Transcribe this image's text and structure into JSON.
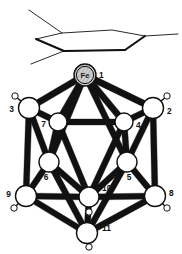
{
  "figure": {
    "kind": "molecular-structure-diagram",
    "background": "#ffffff",
    "line_color": "#111111",
    "sphere_fill": "#ffffff",
    "sphere_stroke": "#111111",
    "metal_fill": "#bdbdbd",
    "metal_stroke": "#111111",
    "width": 182,
    "height": 254
  },
  "arene_ligand": {
    "name": "hexagon-ring",
    "label": "",
    "ring_vertices": [
      {
        "x": 62,
        "y": 33
      },
      {
        "x": 112,
        "y": 30
      },
      {
        "x": 145,
        "y": 36
      },
      {
        "x": 125,
        "y": 50
      },
      {
        "x": 64,
        "y": 51
      },
      {
        "x": 36,
        "y": 39
      }
    ],
    "substituent_lines": [
      {
        "x1": 62,
        "y1": 33,
        "x2": 29,
        "y2": 10
      },
      {
        "x1": 64,
        "y1": 51,
        "x2": 31,
        "y2": 64
      },
      {
        "x1": 145,
        "y1": 36,
        "x2": 178,
        "y2": 34
      }
    ],
    "bold_edges": [
      {
        "x1": 36,
        "y1": 39,
        "x2": 64,
        "y2": 51
      },
      {
        "x1": 64,
        "y1": 51,
        "x2": 125,
        "y2": 50
      },
      {
        "x1": 125,
        "y1": 50,
        "x2": 145,
        "y2": 36
      }
    ]
  },
  "cluster": {
    "name": "icosahedral-ferracarborane-cluster",
    "metal_label": "Fe",
    "vertices": [
      {
        "id": "1",
        "label": "1",
        "element": "Fe",
        "x": 85,
        "y": 75,
        "r": 11,
        "metal": true,
        "label_dx": 14,
        "label_dy": 3,
        "h": null
      },
      {
        "id": "3",
        "label": "3",
        "element": "B",
        "x": 29,
        "y": 108,
        "r": 10.5,
        "metal": false,
        "label_dx": -15,
        "label_dy": 4,
        "h": {
          "x": 15,
          "y": 96,
          "r": 3.2
        }
      },
      {
        "id": "2",
        "label": "2",
        "element": "B",
        "x": 153,
        "y": 108,
        "r": 10.5,
        "metal": false,
        "label_dx": 14,
        "label_dy": 6,
        "h": {
          "x": 167,
          "y": 96,
          "r": 3.2
        }
      },
      {
        "id": "7",
        "label": "7",
        "element": "B",
        "x": 58,
        "y": 122,
        "r": 9,
        "metal": false,
        "label_dx": -12,
        "label_dy": 5,
        "h": null
      },
      {
        "id": "4",
        "label": "4",
        "element": "B",
        "x": 124,
        "y": 122,
        "r": 9,
        "metal": false,
        "label_dx": 12,
        "label_dy": 6,
        "h": null
      },
      {
        "id": "6",
        "label": "6",
        "element": "B",
        "x": 49,
        "y": 162,
        "r": 10,
        "metal": false,
        "label_dx": -3,
        "label_dy": 18,
        "h": {
          "x": 46,
          "y": 157,
          "r": 3.4
        }
      },
      {
        "id": "5",
        "label": "5",
        "element": "B",
        "x": 127,
        "y": 162,
        "r": 10,
        "metal": false,
        "label_dx": 2,
        "label_dy": 18,
        "h": {
          "x": 131,
          "y": 158,
          "r": 3.4
        }
      },
      {
        "id": "9",
        "label": "9",
        "element": "B",
        "x": 26,
        "y": 196,
        "r": 10.5,
        "metal": false,
        "label_dx": -15,
        "label_dy": 1,
        "h": {
          "x": 14,
          "y": 208,
          "r": 3.2
        }
      },
      {
        "id": "10",
        "label": "10",
        "element": "B",
        "x": 89,
        "y": 197,
        "r": 10,
        "metal": false,
        "label_dx": 13,
        "label_dy": -6,
        "h": {
          "x": 89,
          "y": 212,
          "r": 3.2
        }
      },
      {
        "id": "8",
        "label": "8",
        "element": "B",
        "x": 155,
        "y": 196,
        "r": 10.5,
        "metal": false,
        "label_dx": 14,
        "label_dy": 0,
        "h": {
          "x": 167,
          "y": 208,
          "r": 3.2
        }
      },
      {
        "id": "11",
        "label": "11",
        "element": "B",
        "x": 87,
        "y": 233,
        "r": 10.5,
        "metal": false,
        "label_dx": 15,
        "label_dy": -2,
        "h": {
          "x": 89,
          "y": 247,
          "r": 3.2
        }
      }
    ],
    "bonds": [
      {
        "a": "1",
        "b": "3",
        "w": 3.4
      },
      {
        "a": "1",
        "b": "7",
        "w": 3.4
      },
      {
        "a": "1",
        "b": "4",
        "w": 3.4
      },
      {
        "a": "1",
        "b": "2",
        "w": 3.4
      },
      {
        "a": "1",
        "b": "6",
        "w": 3.2
      },
      {
        "a": "1",
        "b": "5",
        "w": 3.2
      },
      {
        "a": "3",
        "b": "7",
        "w": 3.2
      },
      {
        "a": "7",
        "b": "4",
        "w": 3.2
      },
      {
        "a": "4",
        "b": "2",
        "w": 3.2
      },
      {
        "a": "3",
        "b": "6",
        "w": 3.2
      },
      {
        "a": "3",
        "b": "9",
        "w": 3.2
      },
      {
        "a": "2",
        "b": "5",
        "w": 3.2
      },
      {
        "a": "2",
        "b": "8",
        "w": 3.2
      },
      {
        "a": "7",
        "b": "6",
        "w": 3.2
      },
      {
        "a": "7",
        "b": "10",
        "w": 3.2
      },
      {
        "a": "4",
        "b": "5",
        "w": 3.2
      },
      {
        "a": "4",
        "b": "10",
        "w": 3.2
      },
      {
        "a": "6",
        "b": "9",
        "w": 3.2
      },
      {
        "a": "6",
        "b": "10",
        "w": 3.2
      },
      {
        "a": "5",
        "b": "8",
        "w": 3.2
      },
      {
        "a": "5",
        "b": "10",
        "w": 3.2
      },
      {
        "a": "9",
        "b": "10",
        "w": 3.2
      },
      {
        "a": "10",
        "b": "8",
        "w": 3.2
      },
      {
        "a": "9",
        "b": "11",
        "w": 3.2
      },
      {
        "a": "10",
        "b": "11",
        "w": 3.2
      },
      {
        "a": "8",
        "b": "11",
        "w": 3.2
      },
      {
        "a": "6",
        "b": "11",
        "w": 3.2
      },
      {
        "a": "5",
        "b": "11",
        "w": 3.2
      }
    ]
  }
}
